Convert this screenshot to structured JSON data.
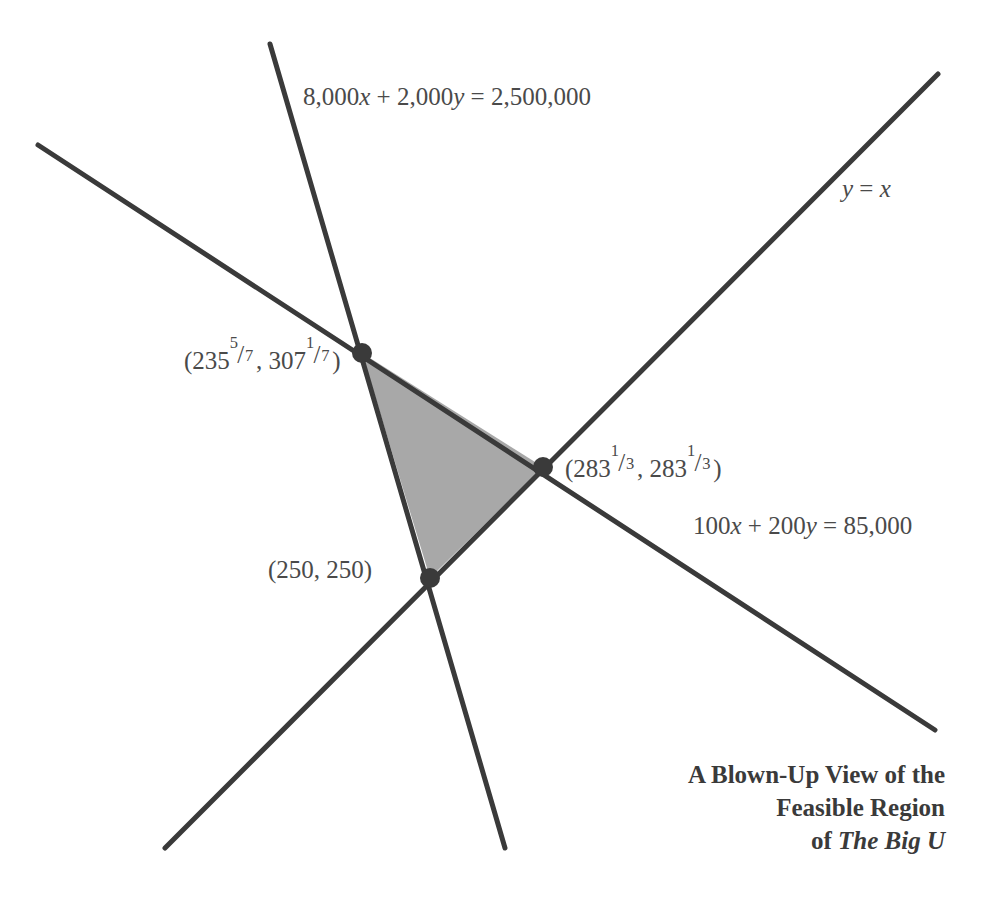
{
  "figure": {
    "type": "linear-programming-feasible-region",
    "background_color": "#ffffff",
    "line_color": "#3a3a3a",
    "shade_color": "#a8a8a8",
    "text_color": "#4a4a4a"
  },
  "equations": {
    "constraint_1": {
      "text_plain": "8,000x + 2,000y = 2,500,000",
      "lhs_a": "8,000",
      "var_x": "x",
      "plus": "+",
      "lhs_b": "2,000",
      "var_y": "y",
      "equals": "=",
      "rhs": "2,500,000"
    },
    "constraint_2": {
      "text_plain": "100x + 200y = 85,000",
      "lhs_a": "100",
      "var_x": "x",
      "plus": "+",
      "lhs_b": "200",
      "var_y": "y",
      "equals": "=",
      "rhs": "85,000"
    },
    "line_y_equals_x": {
      "text_plain": "y = x",
      "var_y": "y",
      "equals": "=",
      "var_x": "x"
    }
  },
  "vertices": [
    {
      "name": "upper-left-vertex",
      "label_plain": "(235 5/7, 307 1/7)",
      "open_paren": "(",
      "x_whole": "235",
      "x_num": "5",
      "x_solidus": "/",
      "x_den": "7",
      "comma": ", ",
      "y_whole": "307",
      "y_num": "1",
      "y_solidus": "/",
      "y_den": "7",
      "close_paren": ")",
      "px": 362,
      "py": 353
    },
    {
      "name": "right-vertex",
      "label_plain": "(283 1/3, 283 1/3)",
      "open_paren": "(",
      "x_whole": "283",
      "x_num": "1",
      "x_solidus": "/",
      "x_den": "3",
      "comma": ", ",
      "y_whole": "283",
      "y_num": "1",
      "y_solidus": "/",
      "y_den": "3",
      "close_paren": ")",
      "px": 543,
      "py": 467
    },
    {
      "name": "bottom-vertex",
      "label_plain": "(250, 250)",
      "px": 430,
      "py": 578
    }
  ],
  "caption": {
    "line1": "A Blown-Up View of the",
    "line2": "Feasible Region",
    "line3_prefix": "of ",
    "line3_book": "The Big U"
  }
}
